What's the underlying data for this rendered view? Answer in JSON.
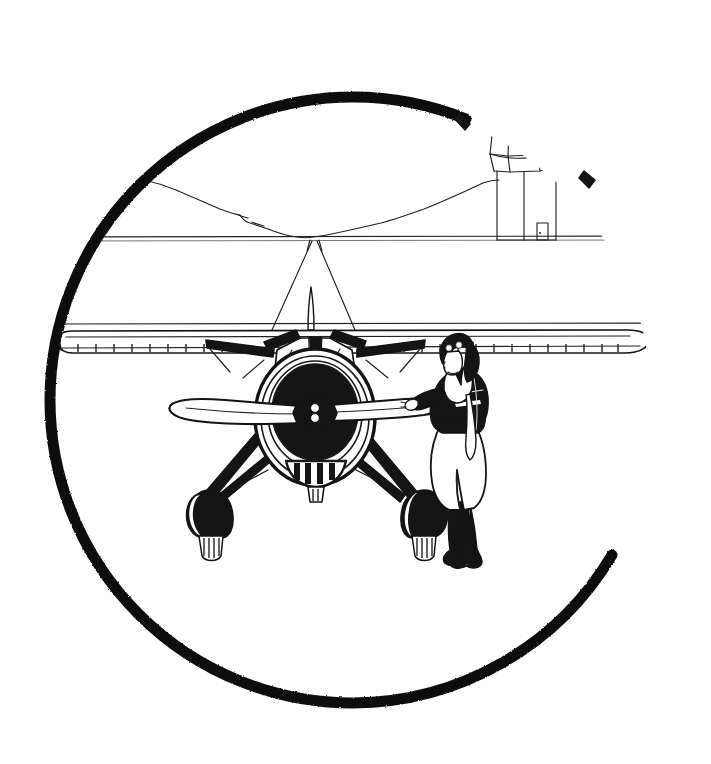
{
  "artwork": {
    "title": "Vintage Aircraft and Pilot Emblem",
    "medium": "pen-and-ink line drawing",
    "palette": {
      "ink": "#151515",
      "paper": "#ffffff",
      "hairline": "#222222"
    },
    "canvas": {
      "width": 711,
      "height": 764
    }
  },
  "border": {
    "label": "Broken circular border ring",
    "center_x": 353,
    "center_y": 400,
    "radius": 303,
    "thickness": 11,
    "gap_label": "Gap at upper right where the control tower breaks the ring",
    "gap_start_degrees": 292,
    "gap_end_degrees": 329
  },
  "scene": {
    "horizon": {
      "label": "Horizon line",
      "y": 237
    },
    "mountains": {
      "label": "Distant mountain ridge silhouette"
    },
    "vanishing_point": {
      "label": "Vanishing point on the horizon",
      "x": 313,
      "y": 236
    }
  },
  "tower": {
    "label": "Control tower with flag",
    "parts": [
      {
        "name": "pennant-flag",
        "label": "Pennant flag"
      },
      {
        "name": "flagpole",
        "label": "Flagpole"
      },
      {
        "name": "tower-spire",
        "label": "Faceted spire roof"
      },
      {
        "name": "tower-cupola",
        "label": "Octagonal glazed cupola"
      },
      {
        "name": "tower-cornice",
        "label": "Cornice band"
      },
      {
        "name": "tower-shaft",
        "label": "Square tower shaft"
      },
      {
        "name": "tower-door",
        "label": "Ground-level doorway"
      }
    ]
  },
  "aircraft": {
    "label": "Single-engine monoplane, front elevation",
    "parts": [
      {
        "name": "upper-wing",
        "label": "Parasol wing"
      },
      {
        "name": "wing-trailing-ribs",
        "label": "Trailing-edge rib stitching"
      },
      {
        "name": "bracing-wires",
        "label": "Cabane bracing wires to the horizon"
      },
      {
        "name": "tail-fin",
        "label": "Vertical tail fin seen head-on"
      },
      {
        "name": "cowling",
        "label": "Engine cowl ring"
      },
      {
        "name": "radial-engine",
        "label": "Radial engine cylinder fan"
      },
      {
        "name": "propeller",
        "label": "Two-blade propeller"
      },
      {
        "name": "spinner-hub",
        "label": "Propeller hub and spinner"
      },
      {
        "name": "air-intake",
        "label": "Louvred chin air intake"
      },
      {
        "name": "landing-gear",
        "label": "Splayed landing gear struts"
      },
      {
        "name": "wheel-spat-left",
        "label": "Left wheel fairing"
      },
      {
        "name": "wheel-spat-right",
        "label": "Right wheel fairing"
      }
    ]
  },
  "pilot": {
    "label": "Standing pilot beside the propeller",
    "parts": [
      {
        "name": "flying-helmet",
        "label": "Leather flying helmet"
      },
      {
        "name": "goggles",
        "label": "Goggles pushed up on the brow"
      },
      {
        "name": "face-profile",
        "label": "Face in left profile"
      },
      {
        "name": "scarf",
        "label": "White silk scarf"
      },
      {
        "name": "flight-jacket",
        "label": "Dark flight jacket"
      },
      {
        "name": "extended-arm",
        "label": "Arm extended to the propeller blade"
      },
      {
        "name": "breeches",
        "label": "Light riding breeches"
      },
      {
        "name": "flying-boots",
        "label": "Tall dark flying boots"
      }
    ]
  }
}
